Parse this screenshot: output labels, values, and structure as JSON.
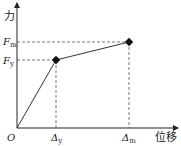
{
  "diagram": {
    "y_axis_label": "力",
    "x_axis_label": "位移",
    "origin_label": "O",
    "y_ticks": [
      {
        "label": "F",
        "sub": "m",
        "y": 42
      },
      {
        "label": "F",
        "sub": "y",
        "y": 60
      }
    ],
    "x_ticks": [
      {
        "label": "Δ",
        "sub": "y",
        "x": 56
      },
      {
        "label": "Δ",
        "sub": "m",
        "x": 129
      }
    ],
    "points": [
      {
        "name": "origin",
        "x": 17,
        "y": 128
      },
      {
        "name": "yield",
        "x": 56,
        "y": 60
      },
      {
        "name": "max",
        "x": 129,
        "y": 42
      }
    ],
    "colors": {
      "line": "#333333",
      "dash": "#555555"
    }
  }
}
